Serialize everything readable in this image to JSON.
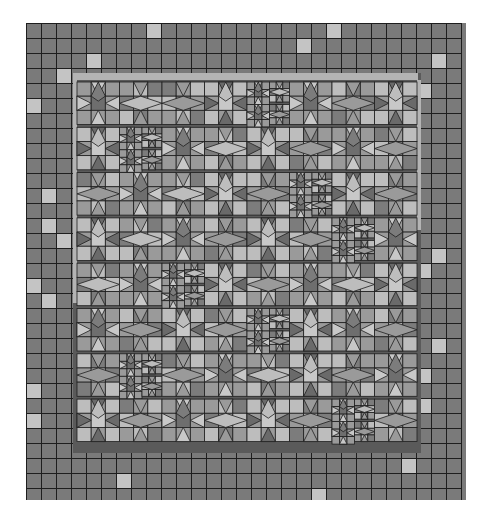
{
  "colors": {
    "background": "#ffffff",
    "border_cell": "#7a7a7a",
    "border_light": "#c4c4c4",
    "grid_line": "#1e1e1e",
    "strip_light": "#b4b4b4",
    "strip_dark": "#5a5a5a",
    "block_light": "#bdbdbd",
    "block_mid": "#9a9a9a",
    "block_dark": "#7c7c7c",
    "star_center_light": "#c8c8c8",
    "star_center_dark": "#6e6e6e",
    "point_light": "#c8c8c8",
    "point_dark": "#6a6a6a"
  },
  "quilt": {
    "x": 26,
    "y": 23,
    "width": 440,
    "height": 477,
    "cell": 15,
    "border_cols": 29,
    "border_rows": 32,
    "light_border_cells": [
      [
        0,
        8
      ],
      [
        0,
        20
      ],
      [
        1,
        18
      ],
      [
        2,
        4
      ],
      [
        2,
        27
      ],
      [
        3,
        2
      ],
      [
        4,
        26
      ],
      [
        5,
        0
      ],
      [
        11,
        1
      ],
      [
        13,
        1
      ],
      [
        14,
        2
      ],
      [
        15,
        27
      ],
      [
        16,
        26
      ],
      [
        17,
        0
      ],
      [
        18,
        1
      ],
      [
        21,
        27
      ],
      [
        23,
        26
      ],
      [
        24,
        0
      ],
      [
        25,
        26
      ],
      [
        26,
        0
      ],
      [
        29,
        25
      ],
      [
        30,
        6
      ],
      [
        31,
        19
      ]
    ]
  },
  "inner": {
    "strip_top": {
      "x": 49,
      "y": 50,
      "w": 343,
      "h": 7
    },
    "strip_left": {
      "x": 47,
      "y": 50,
      "w": 4,
      "h": 230
    },
    "strip_right": {
      "x": 391,
      "y": 57,
      "w": 4,
      "h": 150
    },
    "strip_bottom": {
      "x": 47,
      "y": 422,
      "w": 344,
      "h": 8
    },
    "blocks_x": 51,
    "blocks_y": 59,
    "block_size": 45,
    "cols": 8,
    "rows": 8,
    "star_blocks": [
      [
        0,
        0,
        "d"
      ],
      [
        0,
        3,
        "l"
      ],
      [
        0,
        5,
        "d"
      ],
      [
        0,
        7,
        "l"
      ],
      [
        1,
        0,
        "l"
      ],
      [
        1,
        2,
        "d"
      ],
      [
        1,
        4,
        "l"
      ],
      [
        1,
        6,
        "d"
      ],
      [
        2,
        1,
        "d"
      ],
      [
        2,
        3,
        "l"
      ],
      [
        2,
        6,
        "l"
      ],
      [
        3,
        0,
        "l"
      ],
      [
        3,
        2,
        "d"
      ],
      [
        3,
        4,
        "l"
      ],
      [
        3,
        7,
        "d"
      ],
      [
        4,
        1,
        "d"
      ],
      [
        4,
        3,
        "l"
      ],
      [
        4,
        5,
        "d"
      ],
      [
        4,
        7,
        "l"
      ],
      [
        5,
        0,
        "d"
      ],
      [
        5,
        2,
        "l"
      ],
      [
        5,
        5,
        "l"
      ],
      [
        5,
        6,
        "d"
      ],
      [
        6,
        1,
        "l"
      ],
      [
        6,
        3,
        "d"
      ],
      [
        6,
        5,
        "l"
      ],
      [
        6,
        7,
        "d"
      ],
      [
        7,
        0,
        "l"
      ],
      [
        7,
        2,
        "d"
      ],
      [
        7,
        4,
        "l"
      ],
      [
        7,
        6,
        "d"
      ]
    ],
    "double_blocks": [
      [
        0,
        4
      ],
      [
        1,
        1
      ],
      [
        2,
        5
      ],
      [
        3,
        6
      ],
      [
        4,
        2
      ],
      [
        5,
        4
      ],
      [
        6,
        1
      ],
      [
        7,
        6
      ]
    ]
  }
}
